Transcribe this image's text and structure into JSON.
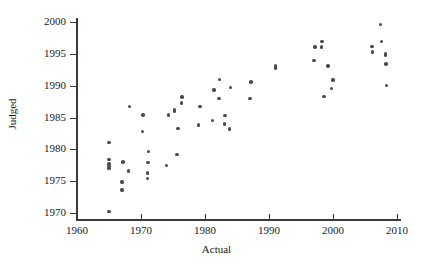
{
  "chart_data": {
    "type": "scatter",
    "title": "",
    "xlabel": "Actual",
    "ylabel": "Judged",
    "xlim": [
      1958,
      2012
    ],
    "ylim": [
      1968.5,
      2001.5
    ],
    "xticks": [
      1960,
      1970,
      1980,
      1990,
      2000,
      2010
    ],
    "yticks": [
      1970,
      1975,
      1980,
      1985,
      1990,
      1995,
      2000
    ],
    "grid": false,
    "legend": null,
    "marker": "filled-circle",
    "marker_color": "#4a4a4f",
    "points": [
      {
        "x": 1965.0,
        "y": 1970.2
      },
      {
        "x": 1965.0,
        "y": 1977.0
      },
      {
        "x": 1965.0,
        "y": 1977.3
      },
      {
        "x": 1965.0,
        "y": 1977.7
      },
      {
        "x": 1965.0,
        "y": 1978.4
      },
      {
        "x": 1965.0,
        "y": 1981.1
      },
      {
        "x": 1967.0,
        "y": 1973.6
      },
      {
        "x": 1967.0,
        "y": 1974.9
      },
      {
        "x": 1967.2,
        "y": 1978.0
      },
      {
        "x": 1968.0,
        "y": 1976.6
      },
      {
        "x": 1968.2,
        "y": 1986.7
      },
      {
        "x": 1970.2,
        "y": 1982.8
      },
      {
        "x": 1970.3,
        "y": 1985.4
      },
      {
        "x": 1971.0,
        "y": 1975.4
      },
      {
        "x": 1971.0,
        "y": 1976.3
      },
      {
        "x": 1971.1,
        "y": 1977.9
      },
      {
        "x": 1971.2,
        "y": 1979.7
      },
      {
        "x": 1974.0,
        "y": 1977.5
      },
      {
        "x": 1974.3,
        "y": 1985.4
      },
      {
        "x": 1975.2,
        "y": 1985.9
      },
      {
        "x": 1975.2,
        "y": 1986.2
      },
      {
        "x": 1975.6,
        "y": 1979.2
      },
      {
        "x": 1975.8,
        "y": 1983.3
      },
      {
        "x": 1976.3,
        "y": 1987.3
      },
      {
        "x": 1976.4,
        "y": 1988.2
      },
      {
        "x": 1979.0,
        "y": 1983.8
      },
      {
        "x": 1979.2,
        "y": 1986.7
      },
      {
        "x": 1981.2,
        "y": 1984.5
      },
      {
        "x": 1981.4,
        "y": 1989.3
      },
      {
        "x": 1982.2,
        "y": 1988.0
      },
      {
        "x": 1982.3,
        "y": 1991.0
      },
      {
        "x": 1983.0,
        "y": 1984.0
      },
      {
        "x": 1983.1,
        "y": 1985.3
      },
      {
        "x": 1983.8,
        "y": 1983.2
      },
      {
        "x": 1984.0,
        "y": 1989.7
      },
      {
        "x": 1987.0,
        "y": 1988.0
      },
      {
        "x": 1987.2,
        "y": 1990.6
      },
      {
        "x": 1991.0,
        "y": 1992.8
      },
      {
        "x": 1991.0,
        "y": 1993.1
      },
      {
        "x": 1997.0,
        "y": 1994.0
      },
      {
        "x": 1997.2,
        "y": 1996.1
      },
      {
        "x": 1998.2,
        "y": 1996.1
      },
      {
        "x": 1998.3,
        "y": 1996.9
      },
      {
        "x": 1998.6,
        "y": 1988.3
      },
      {
        "x": 1999.2,
        "y": 1993.1
      },
      {
        "x": 1999.8,
        "y": 1989.6
      },
      {
        "x": 2000.0,
        "y": 1990.9
      },
      {
        "x": 2006.1,
        "y": 1996.2
      },
      {
        "x": 2006.2,
        "y": 1995.3
      },
      {
        "x": 2007.4,
        "y": 1999.6
      },
      {
        "x": 2007.6,
        "y": 1996.9
      },
      {
        "x": 2008.2,
        "y": 1994.8
      },
      {
        "x": 2008.2,
        "y": 1995.1
      },
      {
        "x": 2008.3,
        "y": 1993.4
      },
      {
        "x": 2008.4,
        "y": 1990.0
      }
    ]
  },
  "axes": {
    "x_tick_labels": [
      "1960",
      "1970",
      "1980",
      "1990",
      "2000",
      "2010"
    ],
    "y_tick_labels": [
      "1970",
      "1975",
      "1980",
      "1985",
      "1990",
      "1995",
      "2000"
    ],
    "x_axis_title": "Actual",
    "y_axis_title": "Judged"
  },
  "colors": {
    "marker": "#4a4a4f",
    "axis": "#3a3a3a",
    "text": "#1a1a1a",
    "background": "#ffffff"
  }
}
